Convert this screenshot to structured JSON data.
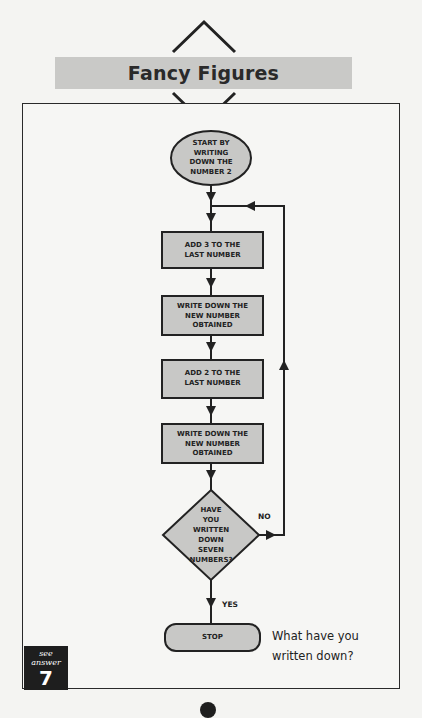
{
  "header": {
    "title": "Fancy Figures"
  },
  "flowchart": {
    "start": "START BY\nWRITING\nDOWN THE\nNUMBER 2",
    "steps": [
      "ADD 3 TO THE\nLAST NUMBER",
      "WRITE DOWN THE\nNEW NUMBER\nOBTAINED",
      "ADD 2 TO THE\nLAST NUMBER",
      "WRITE DOWN THE\nNEW NUMBER\nOBTAINED"
    ],
    "decision": "HAVE\nYOU\nWRITTEN\nDOWN\nSEVEN\nNUMBERS?",
    "no_label": "NO",
    "yes_label": "YES",
    "end": "STOP",
    "colors": {
      "fill": "#c8c8c6",
      "stroke": "#222222"
    }
  },
  "question": "What have you\nwritten down?",
  "answer": {
    "caption": "see answer",
    "number": "7"
  }
}
